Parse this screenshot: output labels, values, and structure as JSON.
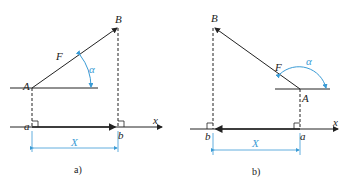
{
  "figure": {
    "panels": [
      {
        "caption": "a)",
        "labels": {
          "B": "B",
          "A": "A",
          "F": "F",
          "alpha": "α",
          "a": "a",
          "b": "b",
          "x": "x",
          "X": "X"
        }
      },
      {
        "caption": "b)",
        "labels": {
          "B": "B",
          "A": "A",
          "F": "F",
          "alpha": "α",
          "a": "a",
          "b": "b",
          "x": "x",
          "X": "X"
        }
      }
    ],
    "colors": {
      "line": "#222222",
      "accent": "#3a9bd5"
    }
  }
}
